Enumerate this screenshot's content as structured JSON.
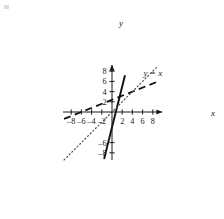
{
  "chart_data": {
    "type": "line",
    "title": "",
    "xlabel": "x",
    "ylabel": "y",
    "xlim": [
      -9.6,
      9.8
    ],
    "ylim": [
      -9.4,
      9.2
    ],
    "grid": false,
    "legend_position": "upper-right-inline",
    "x_ticks": [
      -8,
      -6,
      -4,
      -2,
      2,
      4,
      6,
      8
    ],
    "y_ticks": [
      8,
      6,
      4,
      2,
      -6,
      -8
    ],
    "x_tick_labels": [
      "–8",
      "–6",
      "–4",
      "–2",
      "2",
      "4",
      "6",
      "8"
    ],
    "y_tick_labels": [
      "8",
      "6",
      "4",
      "2",
      "–6",
      "–8"
    ],
    "series": [
      {
        "name": "solid-steep-line",
        "style": "solid",
        "color": "#111111",
        "slope": 4,
        "intercept": -3,
        "x_intercept": 0.75,
        "points": [
          [
            -1.55,
            -9.2
          ],
          [
            2.55,
            7.2
          ]
        ]
      },
      {
        "name": "dashed-shallow-line",
        "style": "dashed",
        "color": "#111111",
        "slope": 0.4,
        "intercept": 2.4,
        "x_intercept": -6,
        "points": [
          [
            -9.4,
            -1.35
          ],
          [
            9.3,
            6.1
          ]
        ]
      },
      {
        "name": "y-equals-x-reference",
        "style": "dotted",
        "color": "#555555",
        "slope": 1,
        "intercept": 0,
        "label": "y = x",
        "points": [
          [
            -9.4,
            -9.4
          ],
          [
            8.9,
            8.9
          ]
        ]
      }
    ],
    "annotations": [
      {
        "text": "y = x",
        "x": 6.2,
        "y": 7.0
      }
    ]
  },
  "axes": {
    "x_axis_name": "x",
    "y_axis_name": "y"
  }
}
